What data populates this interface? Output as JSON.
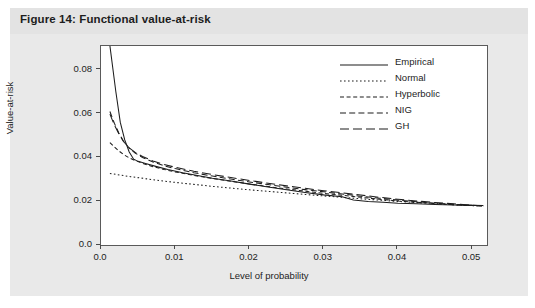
{
  "figure": {
    "caption": "Figure 14: Functional value-at-risk"
  },
  "chart_data": {
    "type": "line",
    "title": "Functional value-at-risk",
    "xlabel": "Level of probability",
    "ylabel": "Value-at-risk",
    "xlim": [
      0.0,
      0.052
    ],
    "ylim": [
      0.0,
      0.0909
    ],
    "xticks": [
      0.0,
      0.01,
      0.02,
      0.03,
      0.04,
      0.05
    ],
    "xtick_labels": [
      "0.0",
      "0.01",
      "0.02",
      "0.03",
      "0.04",
      "0.05"
    ],
    "yticks": [
      0.0,
      0.02,
      0.04,
      0.06,
      0.08
    ],
    "ytick_labels": [
      "0.0",
      "0.02",
      "0.04",
      "0.06",
      "0.08"
    ],
    "grid": false,
    "legend_position": "upper-right",
    "line_color": "#1d1d1d",
    "series": [
      {
        "name": "Empirical",
        "dash": "solid",
        "dasharray": "",
        "points": [
          [
            0.0012,
            0.091
          ],
          [
            0.002,
            0.07
          ],
          [
            0.0026,
            0.056
          ],
          [
            0.0032,
            0.048
          ],
          [
            0.0038,
            0.0425
          ],
          [
            0.0044,
            0.0392
          ],
          [
            0.005,
            0.0382
          ],
          [
            0.006,
            0.0372
          ],
          [
            0.0075,
            0.0358
          ],
          [
            0.009,
            0.0345
          ],
          [
            0.011,
            0.033
          ],
          [
            0.013,
            0.0317
          ],
          [
            0.015,
            0.0305
          ],
          [
            0.0175,
            0.0292
          ],
          [
            0.02,
            0.0278
          ],
          [
            0.0225,
            0.0265
          ],
          [
            0.025,
            0.0252
          ],
          [
            0.0275,
            0.024
          ],
          [
            0.03,
            0.0229
          ],
          [
            0.0325,
            0.022
          ],
          [
            0.034,
            0.0206
          ],
          [
            0.036,
            0.0199
          ],
          [
            0.038,
            0.0195
          ],
          [
            0.04,
            0.0191
          ],
          [
            0.0425,
            0.0188
          ],
          [
            0.045,
            0.0185
          ],
          [
            0.0475,
            0.0183
          ],
          [
            0.05,
            0.0181
          ],
          [
            0.0515,
            0.018
          ]
        ]
      },
      {
        "name": "Normal",
        "dash": "dotted",
        "dasharray": "1.6,2.4",
        "points": [
          [
            0.0012,
            0.0327
          ],
          [
            0.0025,
            0.032
          ],
          [
            0.004,
            0.0312
          ],
          [
            0.006,
            0.0303
          ],
          [
            0.008,
            0.0294
          ],
          [
            0.01,
            0.0286
          ],
          [
            0.0125,
            0.0277
          ],
          [
            0.015,
            0.0268
          ],
          [
            0.0175,
            0.026
          ],
          [
            0.02,
            0.0252
          ],
          [
            0.0225,
            0.0245
          ],
          [
            0.025,
            0.0238
          ],
          [
            0.0275,
            0.0231
          ],
          [
            0.03,
            0.0224
          ],
          [
            0.0325,
            0.0218
          ],
          [
            0.035,
            0.0211
          ],
          [
            0.0375,
            0.0205
          ],
          [
            0.04,
            0.0199
          ],
          [
            0.0425,
            0.0194
          ],
          [
            0.045,
            0.0189
          ],
          [
            0.0475,
            0.0184
          ],
          [
            0.05,
            0.018
          ],
          [
            0.0515,
            0.0178
          ]
        ]
      },
      {
        "name": "Hyperbolic",
        "dash": "short-dash",
        "dasharray": "4,2.6",
        "points": [
          [
            0.0012,
            0.0468
          ],
          [
            0.0018,
            0.0448
          ],
          [
            0.0024,
            0.043
          ],
          [
            0.003,
            0.0414
          ],
          [
            0.0038,
            0.0398
          ],
          [
            0.0046,
            0.0386
          ],
          [
            0.0056,
            0.0373
          ],
          [
            0.007,
            0.0358
          ],
          [
            0.0085,
            0.0345
          ],
          [
            0.01,
            0.0334
          ],
          [
            0.0125,
            0.0318
          ],
          [
            0.015,
            0.0304
          ],
          [
            0.0175,
            0.0291
          ],
          [
            0.02,
            0.0279
          ],
          [
            0.0225,
            0.0267
          ],
          [
            0.025,
            0.0256
          ],
          [
            0.0275,
            0.0246
          ],
          [
            0.03,
            0.0236
          ],
          [
            0.0325,
            0.0227
          ],
          [
            0.035,
            0.0218
          ],
          [
            0.0375,
            0.0209
          ],
          [
            0.04,
            0.0201
          ],
          [
            0.0425,
            0.0195
          ],
          [
            0.045,
            0.0189
          ],
          [
            0.0475,
            0.0184
          ],
          [
            0.05,
            0.018
          ],
          [
            0.0515,
            0.0178
          ]
        ]
      },
      {
        "name": "NIG",
        "dash": "medium-dash",
        "dasharray": "6,3.2",
        "points": [
          [
            0.0012,
            0.061
          ],
          [
            0.0018,
            0.0556
          ],
          [
            0.0024,
            0.0512
          ],
          [
            0.003,
            0.0476
          ],
          [
            0.0038,
            0.0443
          ],
          [
            0.0046,
            0.042
          ],
          [
            0.0056,
            0.04
          ],
          [
            0.007,
            0.0379
          ],
          [
            0.0085,
            0.0362
          ],
          [
            0.01,
            0.0349
          ],
          [
            0.0125,
            0.033
          ],
          [
            0.015,
            0.0315
          ],
          [
            0.0175,
            0.0301
          ],
          [
            0.02,
            0.0288
          ],
          [
            0.0225,
            0.0276
          ],
          [
            0.025,
            0.0264
          ],
          [
            0.0275,
            0.0253
          ],
          [
            0.03,
            0.0243
          ],
          [
            0.0325,
            0.0233
          ],
          [
            0.035,
            0.0223
          ],
          [
            0.0375,
            0.0214
          ],
          [
            0.04,
            0.0205
          ],
          [
            0.0425,
            0.0198
          ],
          [
            0.045,
            0.0191
          ],
          [
            0.0475,
            0.0186
          ],
          [
            0.05,
            0.0181
          ],
          [
            0.0515,
            0.0179
          ]
        ]
      },
      {
        "name": "GH",
        "dash": "long-dash",
        "dasharray": "9,4",
        "points": [
          [
            0.0012,
            0.0598
          ],
          [
            0.0018,
            0.0548
          ],
          [
            0.0024,
            0.0508
          ],
          [
            0.003,
            0.0474
          ],
          [
            0.0038,
            0.0444
          ],
          [
            0.0046,
            0.0423
          ],
          [
            0.0056,
            0.0404
          ],
          [
            0.007,
            0.0384
          ],
          [
            0.0085,
            0.0368
          ],
          [
            0.01,
            0.0355
          ],
          [
            0.0125,
            0.0337
          ],
          [
            0.015,
            0.0322
          ],
          [
            0.0175,
            0.0308
          ],
          [
            0.02,
            0.0295
          ],
          [
            0.0225,
            0.0282
          ],
          [
            0.025,
            0.027
          ],
          [
            0.0275,
            0.0259
          ],
          [
            0.03,
            0.0248
          ],
          [
            0.0325,
            0.0238
          ],
          [
            0.035,
            0.0228
          ],
          [
            0.0375,
            0.0218
          ],
          [
            0.04,
            0.0209
          ],
          [
            0.0425,
            0.0201
          ],
          [
            0.045,
            0.0194
          ],
          [
            0.0475,
            0.0188
          ],
          [
            0.05,
            0.0182
          ],
          [
            0.0515,
            0.0179
          ]
        ]
      }
    ]
  }
}
